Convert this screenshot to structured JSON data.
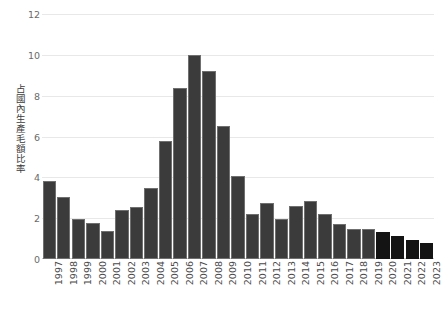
{
  "chart_data": {
    "type": "bar",
    "title": "",
    "subtitle": "",
    "xlabel": "",
    "ylabel": "占國內生產毛額比率",
    "ylim": [
      0,
      12
    ],
    "yticks": [
      0,
      2,
      4,
      6,
      8,
      10,
      12
    ],
    "ytick_labels": [
      "0",
      "2",
      "4",
      "6",
      "8",
      "10",
      "12"
    ],
    "grid": true,
    "legend": "none",
    "categories": [
      "1997",
      "1998",
      "1999",
      "2000",
      "2001",
      "2002",
      "2003",
      "2004",
      "2005",
      "2006",
      "2007",
      "2008",
      "2009",
      "2010",
      "2011",
      "2012",
      "2013",
      "2014",
      "2015",
      "2016",
      "2017",
      "2018",
      "2019",
      "2020",
      "2021",
      "2022",
      "2023"
    ],
    "values": [
      3.8,
      3.05,
      1.95,
      1.75,
      1.35,
      2.4,
      2.55,
      3.5,
      5.8,
      8.4,
      10.0,
      9.2,
      6.5,
      4.05,
      2.2,
      2.75,
      1.95,
      2.6,
      2.85,
      2.2,
      1.7,
      1.45,
      1.45,
      1.3,
      1.15,
      0.95,
      0.8
    ],
    "series_kind": [
      "actual",
      "actual",
      "actual",
      "actual",
      "actual",
      "actual",
      "actual",
      "actual",
      "actual",
      "actual",
      "actual",
      "actual",
      "actual",
      "actual",
      "actual",
      "actual",
      "actual",
      "actual",
      "actual",
      "actual",
      "actual",
      "actual",
      "actual",
      "forecast",
      "forecast",
      "forecast",
      "forecast"
    ],
    "colors": {
      "bar_actual": "#3b3b3b",
      "bar_forecast": "#141414",
      "bar_edge": "#6f6f6f",
      "gridline": "#e8e8e8",
      "axis": "#c8c8c8",
      "tick_text": "#6a6a6a",
      "background": "#ffffff"
    }
  }
}
